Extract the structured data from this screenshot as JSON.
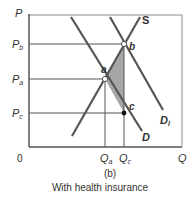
{
  "diagram": {
    "panel_label": "(b)",
    "caption": "With health insurance",
    "axes": {
      "y_label": "P",
      "x_label": "Q",
      "origin": "0"
    },
    "price_labels": [
      {
        "main": "P",
        "sub": "b"
      },
      {
        "main": "P",
        "sub": "a"
      },
      {
        "main": "P",
        "sub": "c"
      }
    ],
    "quantity_labels": [
      {
        "main": "Q",
        "sub": "a"
      },
      {
        "main": "Q",
        "sub": "c"
      }
    ],
    "curves": {
      "supply": "S",
      "demand": "D",
      "demand_insured": {
        "main": "D",
        "sub": "I"
      }
    },
    "points": {
      "a": "a",
      "b": "b",
      "c": "c"
    },
    "colors": {
      "line": "#555555",
      "shade": "#a6a6a6",
      "text": "#333333"
    }
  }
}
